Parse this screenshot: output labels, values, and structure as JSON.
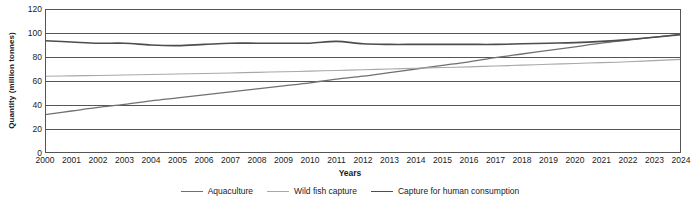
{
  "chart_data": {
    "type": "line",
    "title": "",
    "xlabel": "Years",
    "ylabel": "Quantity (million tonnes)",
    "xlim": [
      2000,
      2024
    ],
    "ylim": [
      0,
      120
    ],
    "yticks": [
      0,
      20,
      40,
      60,
      80,
      100,
      120
    ],
    "grid": true,
    "legend_position": "bottom",
    "x": [
      2000,
      2001,
      2002,
      2003,
      2004,
      2005,
      2006,
      2007,
      2008,
      2009,
      2010,
      2011,
      2012,
      2013,
      2014,
      2015,
      2016,
      2017,
      2018,
      2019,
      2020,
      2021,
      2022,
      2023,
      2024
    ],
    "categories": [
      "2000",
      "2001",
      "2002",
      "2003",
      "2004",
      "2005",
      "2006",
      "2007",
      "2008",
      "2009",
      "2010",
      "2011",
      "2012",
      "2013",
      "2014",
      "2015",
      "2016",
      "2017",
      "2018",
      "2019",
      "2020",
      "2021",
      "2022",
      "2023",
      "2024"
    ],
    "series": [
      {
        "name": "Aquaculture",
        "color": "#707070",
        "width": 1.3,
        "values": [
          32,
          35,
          38,
          40.5,
          43.5,
          46,
          48.5,
          51,
          53.5,
          56,
          58.5,
          61.5,
          64,
          67,
          70,
          73,
          76,
          79.5,
          82.5,
          85.5,
          88.5,
          91.5,
          94,
          96.5,
          99
        ]
      },
      {
        "name": "Wild fish capture",
        "color": "#a8a8a8",
        "width": 1.1,
        "values": [
          64,
          64.3,
          64.6,
          65,
          65.4,
          65.8,
          66.2,
          66.7,
          67.2,
          67.7,
          68.2,
          68.8,
          69.4,
          70,
          70.6,
          71.2,
          71.8,
          72.5,
          73.2,
          73.9,
          74.6,
          75.3,
          76,
          77,
          78
        ]
      },
      {
        "name": "Capture for human consumption",
        "color": "#4d4d4d",
        "width": 1.6,
        "values": [
          93.5,
          92.5,
          91.5,
          91.5,
          90,
          89.5,
          90.5,
          91.5,
          91.5,
          91.5,
          91.5,
          93,
          91,
          90.5,
          90.5,
          90.5,
          90.5,
          90.5,
          91,
          91.5,
          92,
          93,
          94.5,
          96.5,
          98.5
        ]
      }
    ]
  },
  "legend": {
    "items": [
      {
        "label": "Aquaculture"
      },
      {
        "label": "Wild fish capture"
      },
      {
        "label": "Capture for human consumption"
      }
    ]
  },
  "axes": {
    "ylabel": "Quantity (million tonnes)",
    "xlabel": "Years"
  }
}
